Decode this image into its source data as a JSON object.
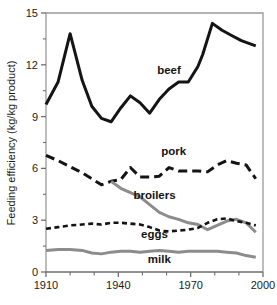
{
  "chart_data": {
    "type": "line",
    "title": "",
    "xlabel": "",
    "ylabel": "Feeding efficiency (kg/kg product)",
    "xlim": [
      1910,
      2000
    ],
    "ylim": [
      0,
      15
    ],
    "xticks": [
      1910,
      1940,
      1970,
      2000
    ],
    "xtick_labels": [
      "1910",
      "1940",
      "1970",
      "2000"
    ],
    "xminor_ticks": [
      1920,
      1930,
      1950,
      1960,
      1980,
      1990
    ],
    "yticks": [
      0,
      3,
      6,
      9,
      12,
      15
    ],
    "ytick_labels": [
      "0",
      "3",
      "6",
      "9",
      "12",
      "15"
    ],
    "yminor_ticks": [
      1.5,
      4.5,
      7.5,
      10.5,
      13.5
    ],
    "grid": false,
    "legend_position": "inline-annotations",
    "series": [
      {
        "name": "beef",
        "label": "beef",
        "color": "#141414",
        "style": "solid",
        "width": 3.0,
        "label_x": 1961,
        "label_y": 11.45,
        "x": [
          1910,
          1915,
          1920,
          1925,
          1929,
          1933,
          1937,
          1941,
          1945,
          1949,
          1953,
          1957,
          1961,
          1965,
          1969,
          1973,
          1975,
          1979,
          1983,
          1987,
          1991,
          1997
        ],
        "y": [
          9.7,
          11.0,
          13.8,
          11.1,
          9.6,
          8.9,
          8.7,
          9.5,
          10.2,
          9.8,
          9.2,
          10.0,
          10.6,
          11.0,
          11.0,
          11.9,
          12.6,
          14.4,
          14.0,
          13.7,
          13.4,
          13.1
        ]
      },
      {
        "name": "pork",
        "label": "pork",
        "color": "#141414",
        "style": "dashed-long",
        "width": 3.0,
        "label_x": 1963,
        "label_y": 6.75,
        "x": [
          1910,
          1915,
          1920,
          1925,
          1929,
          1933,
          1937,
          1941,
          1945,
          1949,
          1953,
          1957,
          1961,
          1965,
          1969,
          1973,
          1977,
          1981,
          1985,
          1989,
          1993,
          1997
        ],
        "y": [
          6.75,
          6.45,
          6.1,
          5.75,
          5.4,
          5.05,
          5.25,
          5.35,
          6.05,
          5.5,
          5.5,
          5.55,
          6.05,
          5.85,
          5.85,
          5.85,
          5.8,
          6.2,
          6.45,
          6.3,
          6.2,
          5.4
        ]
      },
      {
        "name": "broilers",
        "label": "broilers",
        "color": "#8c8c8c",
        "style": "solid",
        "width": 3.0,
        "label_x": 1955,
        "label_y": 4.25,
        "x": [
          1937,
          1941,
          1945,
          1949,
          1953,
          1957,
          1961,
          1965,
          1969,
          1973,
          1977,
          1981,
          1985,
          1989,
          1993,
          1997
        ],
        "y": [
          5.25,
          4.85,
          4.6,
          4.35,
          3.9,
          3.45,
          3.2,
          3.05,
          2.85,
          2.75,
          2.45,
          2.7,
          2.95,
          3.05,
          2.85,
          2.3
        ]
      },
      {
        "name": "eggs",
        "label": "eggs",
        "color": "#141414",
        "style": "dashed-short",
        "width": 2.6,
        "label_x": 1955,
        "label_y": 1.95,
        "x": [
          1910,
          1915,
          1920,
          1925,
          1929,
          1933,
          1937,
          1941,
          1945,
          1949,
          1953,
          1957,
          1961,
          1965,
          1969,
          1973,
          1977,
          1981,
          1985,
          1989,
          1993,
          1997
        ],
        "y": [
          2.5,
          2.6,
          2.7,
          2.75,
          2.8,
          2.75,
          2.85,
          2.85,
          2.8,
          2.75,
          2.6,
          2.4,
          2.35,
          2.4,
          2.45,
          2.55,
          2.85,
          3.05,
          3.1,
          2.95,
          2.85,
          2.7
        ]
      },
      {
        "name": "milk",
        "label": "milk",
        "color": "#8c8c8c",
        "style": "solid",
        "width": 3.0,
        "label_x": 1957,
        "label_y": 0.55,
        "x": [
          1910,
          1915,
          1920,
          1925,
          1929,
          1933,
          1937,
          1941,
          1945,
          1949,
          1953,
          1957,
          1961,
          1965,
          1969,
          1973,
          1977,
          1981,
          1985,
          1989,
          1993,
          1997
        ],
        "y": [
          1.25,
          1.3,
          1.3,
          1.25,
          1.1,
          1.05,
          1.15,
          1.2,
          1.2,
          1.15,
          1.2,
          1.25,
          1.2,
          1.15,
          1.2,
          1.2,
          1.2,
          1.2,
          1.15,
          1.1,
          0.95,
          0.85
        ]
      }
    ]
  },
  "axes": {
    "spine_color": "#9a9a9a",
    "tick_color": "#6e6e6e",
    "y_title": "Feeding efficiency (kg/kg product)"
  }
}
